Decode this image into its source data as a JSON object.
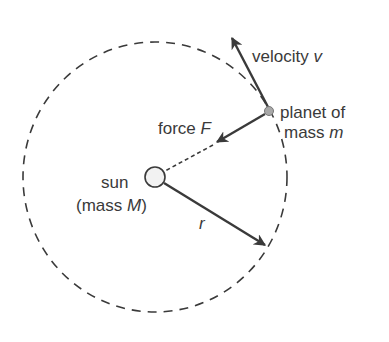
{
  "diagram": {
    "labels": {
      "velocity": {
        "text": "velocity ",
        "symbol": "v"
      },
      "planet_line1": "planet of",
      "planet_line2": {
        "text": "mass ",
        "symbol": "m"
      },
      "force": {
        "text": "force ",
        "symbol": "F"
      },
      "sun_line1": "sun",
      "sun_line2": {
        "text": "(mass ",
        "symbol": "M",
        "close": ")"
      },
      "radius": "r"
    },
    "colors": {
      "line": "#3a3a3a",
      "sun_fill": "#f2f2f2",
      "planet_fill": "#a8a8a8",
      "background": "#ffffff"
    }
  }
}
